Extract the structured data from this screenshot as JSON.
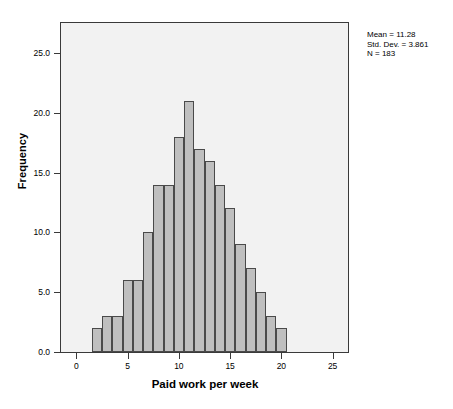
{
  "chart_data": {
    "type": "bar",
    "title": "",
    "xlabel": "Paid work per week",
    "ylabel": "Frequency",
    "xlim": [
      -1.5,
      26.5
    ],
    "ylim": [
      0,
      27.5
    ],
    "grid": false,
    "bin_width": 1.0,
    "bin_starts": [
      1.5,
      2.5,
      3.5,
      4.5,
      5.5,
      6.5,
      7.5,
      8.5,
      9.5,
      10.5,
      11.5,
      12.5,
      13.5,
      14.5,
      15.5,
      16.5,
      17.5,
      18.5,
      19.5
    ],
    "categories": [
      "1.5-2.5",
      "2.5-3.5",
      "3.5-4.5",
      "4.5-5.5",
      "5.5-6.5",
      "6.5-7.5",
      "7.5-8.5",
      "8.5-9.5",
      "9.5-10.5",
      "10.5-11.5",
      "11.5-12.5",
      "12.5-13.5",
      "13.5-14.5",
      "14.5-15.5",
      "15.5-16.5",
      "16.5-17.5",
      "17.5-18.5",
      "18.5-19.5",
      "19.5-20.5"
    ],
    "values": [
      2,
      3,
      3,
      6,
      6,
      10,
      14,
      14,
      18,
      21,
      17,
      16,
      14,
      12,
      9,
      7,
      5,
      3,
      2
    ],
    "xticks": [
      0,
      5,
      10,
      15,
      20,
      25
    ],
    "xticklabels": [
      "0",
      "5",
      "10",
      "15",
      "20",
      "25"
    ],
    "yticks": [
      0.0,
      5.0,
      10.0,
      15.0,
      20.0,
      25.0
    ],
    "yticklabels": [
      "0.0",
      "5.0",
      "10.0",
      "15.0",
      "20.0",
      "25.0"
    ],
    "bar_color": "#bfbfbf",
    "bar_edge_color": "#4a4a4a",
    "plot_background": "#f2f2f2",
    "annotations": {
      "mean": "Mean = 11.28",
      "std_dev": "Std. Dev. = 3.861",
      "n": "N = 183"
    }
  }
}
